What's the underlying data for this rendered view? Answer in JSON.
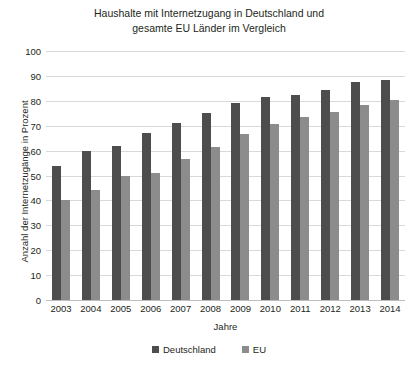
{
  "chart_data": {
    "type": "bar",
    "title": "Haushalte mit Internetzugang in Deutschland und gesamte EU Länder im Vergleich",
    "title_line1": "Haushalte mit Internetzugang in Deutschland und",
    "title_line2": "gesamte EU Länder im Vergleich",
    "xlabel": "Jahre",
    "ylabel": "Anzahl der Internetzugänge in Prozent",
    "categories": [
      "2003",
      "2004",
      "2005",
      "2006",
      "2007",
      "2008",
      "2009",
      "2010",
      "2011",
      "2012",
      "2013",
      "2014"
    ],
    "series": [
      {
        "name": "Deutschland",
        "color": "#4d4d4d",
        "values": [
          54,
          60,
          62,
          67,
          71,
          75,
          79,
          81.5,
          82.5,
          84.5,
          87.5,
          88.5
        ]
      },
      {
        "name": "EU",
        "color": "#8c8c8c",
        "values": [
          40,
          44,
          50,
          51,
          56.5,
          61.5,
          66.5,
          70.5,
          73.5,
          75.5,
          78.5,
          80.5
        ]
      }
    ],
    "ylim": [
      0,
      100
    ],
    "yticks": [
      0,
      10,
      20,
      30,
      40,
      50,
      60,
      70,
      80,
      90,
      100
    ],
    "ytick_labels": [
      "0",
      "10",
      "20",
      "30",
      "40",
      "50",
      "60",
      "70",
      "80",
      "90",
      "100"
    ],
    "grid": true,
    "legend_position": "bottom",
    "legend": [
      "Deutschland",
      "EU"
    ]
  }
}
